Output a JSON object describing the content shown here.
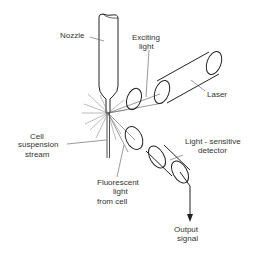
{
  "diagram": {
    "labels": {
      "nozzle": "Nozzle",
      "exciting_light_1": "Exciting",
      "exciting_light_2": "light",
      "laser": "Laser",
      "cell_stream_1": "Cell",
      "cell_stream_2": "suspension",
      "cell_stream_3": "stream",
      "fluorescent_1": "Fluorescent",
      "fluorescent_2": "light",
      "fluorescent_3": "from cell",
      "detector_1": "Light - sensitive",
      "detector_2": "detector",
      "output_1": "Output",
      "output_2": "signal"
    },
    "colors": {
      "line": "#222222",
      "text": "#333333",
      "background": "#ffffff"
    }
  }
}
